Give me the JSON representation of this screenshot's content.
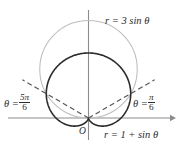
{
  "figure": {
    "kind": "polar-graph",
    "title": "",
    "background_color": "#ffffff",
    "labels": {
      "circle_equation": "r = 3 sin θ",
      "cardioid_equation": "r = 1 + sin θ",
      "origin": "O",
      "theta_right_prefix": "θ =",
      "theta_right_numerator": "π",
      "theta_right_denominator": "6",
      "theta_left_prefix": "θ =",
      "theta_left_numerator": "5π",
      "theta_left_denominator": "6"
    },
    "colors": {
      "axis": "#8c8c8c",
      "cardioid": "#2b2b2b",
      "circle": "#bdbdbd",
      "dashed_ray": "#555555",
      "text": "#2b2b2b"
    }
  },
  "chart_data": {
    "type": "line",
    "subtype": "polar-curves",
    "title": "",
    "xlabel": "",
    "ylabel": "",
    "grid": false,
    "legend_position": "inline-annotations",
    "axes": {
      "origin_px": [
        88.5,
        118
      ],
      "x_axis_y_px": 118,
      "y_axis_x_px": 88.5,
      "x_axis_range_px": [
        8,
        174
      ],
      "y_axis_range_px": [
        10,
        140
      ],
      "x_arrow": true,
      "y_arrow": false,
      "pixels_per_unit": 32.5
    },
    "series": [
      {
        "name": "r = 3 sin θ",
        "equation": "r = 3*sin(theta)",
        "kind": "circle",
        "color": "#bdbdbd",
        "linewidth": 1,
        "center_polar": [
          1.5,
          1.5707963
        ],
        "radius": 1.5,
        "theta_range": [
          0,
          3.1415927
        ],
        "max_r": 3
      },
      {
        "name": "r = 1 + sin θ",
        "equation": "r = 1 + sin(theta)",
        "kind": "cardioid",
        "color": "#2b2b2b",
        "linewidth": 1.6,
        "theta_range": [
          0,
          6.2831853
        ],
        "max_r": 2,
        "cusp_theta": 4.712389
      }
    ],
    "rays": [
      {
        "name": "theta = pi/6",
        "theta_rad": 0.5235988,
        "theta_label": "θ = π/6",
        "style": "dashed",
        "color": "#555555",
        "r_extent": 2.35
      },
      {
        "name": "theta = 5pi/6",
        "theta_rad": 2.6179939,
        "theta_label": "θ = 5π/6",
        "style": "dashed",
        "color": "#555555",
        "r_extent": 2.35
      }
    ],
    "intersections": [
      {
        "theta_rad": 0.5235988,
        "r": 1.5
      },
      {
        "theta_rad": 2.6179939,
        "r": 1.5
      },
      {
        "theta_rad": 4.712389,
        "r": 0,
        "note": "pole"
      }
    ],
    "annotations": [
      {
        "text": "r = 3 sin θ",
        "x_px": 105,
        "y_px": 16
      },
      {
        "text": "r = 1 + sin θ",
        "x_px": 104,
        "y_px": 130
      },
      {
        "text": "θ = π/6",
        "x_px": 133,
        "y_px": 93
      },
      {
        "text": "θ = 5π/6",
        "x_px": 4,
        "y_px": 93
      },
      {
        "text": "O",
        "x_px": 79,
        "y_px": 127
      }
    ]
  }
}
